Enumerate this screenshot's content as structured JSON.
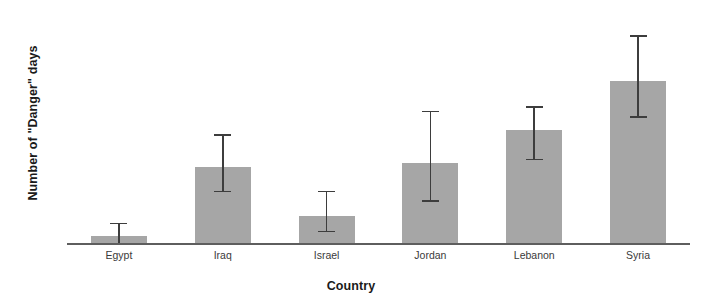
{
  "chart_data": {
    "type": "bar",
    "title": "",
    "xlabel": "Country",
    "ylabel": "Number of \"Danger\" days",
    "categories": [
      "Egypt",
      "Iraq",
      "Israel",
      "Jordan",
      "Lebanon",
      "Syria"
    ],
    "values": [
      1.2,
      13.1,
      4.7,
      13.8,
      19.4,
      27.9
    ],
    "error_upper": [
      3.5,
      18.8,
      9.0,
      22.8,
      23.6,
      35.8
    ],
    "error_lower": [
      0.0,
      9.0,
      2.1,
      7.4,
      14.5,
      21.9
    ],
    "ylim": [
      0,
      40
    ],
    "yticks": [
      0,
      10,
      20,
      30,
      40
    ],
    "ytick_labels": [
      "0",
      "10",
      "20",
      "30",
      "40"
    ],
    "grid": false,
    "legend": null,
    "bar_color": "#a6a6a6",
    "error_color": "#3d3d3d",
    "axis_color": "#5e5e5e"
  }
}
